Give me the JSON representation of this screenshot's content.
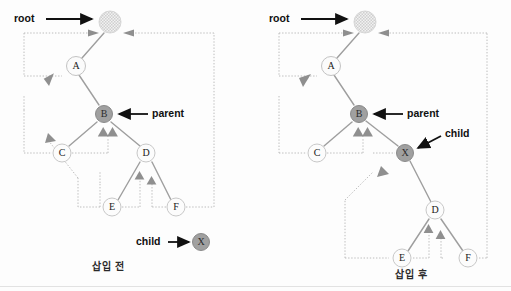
{
  "figure": {
    "title_left": "삽입 전",
    "title_right": "삽입 후",
    "type": "threaded-binary-tree-insertion"
  },
  "colors": {
    "link": "#9a9a9a",
    "thread": "#b9b9b9",
    "node_stroke": "#b0b0b0",
    "node_fill_plain": "#fbfbfb",
    "node_fill_shaded": "#9c9c9c",
    "node_fill_hatched": "#dedede",
    "annotation_arrow": "#111111",
    "text": "#1a1a1a"
  },
  "left": {
    "caption": "삽입 전",
    "annotations": [
      {
        "label": "root",
        "target": "root-node",
        "arrow": "right"
      },
      {
        "label": "parent",
        "target": "node-b",
        "arrow": "left"
      },
      {
        "label": "child",
        "target": "node-x",
        "arrow": "right"
      }
    ],
    "nodes": [
      {
        "id": "root",
        "label": "",
        "style": "hatched",
        "x": 110,
        "y": 22
      },
      {
        "id": "A",
        "label": "A",
        "style": "plain",
        "x": 76,
        "y": 66
      },
      {
        "id": "B",
        "label": "B",
        "style": "shaded",
        "x": 104,
        "y": 114
      },
      {
        "id": "C",
        "label": "C",
        "style": "plain",
        "x": 62,
        "y": 153
      },
      {
        "id": "D",
        "label": "D",
        "style": "plain",
        "x": 146,
        "y": 153
      },
      {
        "id": "E",
        "label": "E",
        "style": "plain",
        "x": 112,
        "y": 207
      },
      {
        "id": "F",
        "label": "F",
        "style": "plain",
        "x": 176,
        "y": 207
      },
      {
        "id": "X",
        "label": "X",
        "style": "shaded",
        "x": 201,
        "y": 242
      }
    ],
    "links": [
      {
        "from": "root",
        "to": "A"
      },
      {
        "from": "A",
        "to": "B"
      },
      {
        "from": "B",
        "to": "C"
      },
      {
        "from": "B",
        "to": "D"
      },
      {
        "from": "D",
        "to": "E"
      },
      {
        "from": "D",
        "to": "F"
      }
    ]
  },
  "right": {
    "caption": "삽입 후",
    "annotations": [
      {
        "label": "root",
        "target": "root-node",
        "arrow": "right"
      },
      {
        "label": "parent",
        "target": "node-b",
        "arrow": "left"
      },
      {
        "label": "child",
        "target": "node-x",
        "arrow": "left-down"
      }
    ],
    "nodes": [
      {
        "id": "root",
        "label": "",
        "style": "hatched",
        "x": 110,
        "y": 22
      },
      {
        "id": "A",
        "label": "A",
        "style": "plain",
        "x": 76,
        "y": 66
      },
      {
        "id": "B",
        "label": "B",
        "style": "shaded",
        "x": 104,
        "y": 114
      },
      {
        "id": "C",
        "label": "C",
        "style": "plain",
        "x": 62,
        "y": 153
      },
      {
        "id": "X",
        "label": "X",
        "style": "shaded",
        "x": 150,
        "y": 153
      },
      {
        "id": "D",
        "label": "D",
        "style": "plain",
        "x": 180,
        "y": 210
      },
      {
        "id": "E",
        "label": "E",
        "style": "plain",
        "x": 147,
        "y": 258
      },
      {
        "id": "F",
        "label": "F",
        "style": "plain",
        "x": 213,
        "y": 258
      }
    ],
    "links": [
      {
        "from": "root",
        "to": "A"
      },
      {
        "from": "A",
        "to": "B"
      },
      {
        "from": "B",
        "to": "C"
      },
      {
        "from": "B",
        "to": "X"
      },
      {
        "from": "X",
        "to": "D"
      },
      {
        "from": "D",
        "to": "E"
      },
      {
        "from": "D",
        "to": "F"
      }
    ]
  }
}
